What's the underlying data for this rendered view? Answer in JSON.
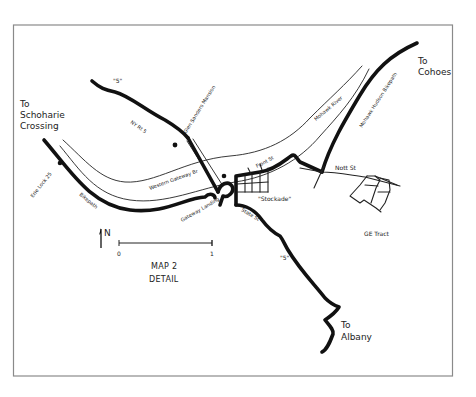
{
  "map": {
    "title_line1": "MAP 2",
    "title_line2": "DETAIL",
    "frame_color": "#8a8a8a",
    "ink_color": "#111111",
    "background": "#ffffff"
  },
  "destinations": {
    "schoharie_line1": "To",
    "schoharie_line2": "Schoharie",
    "schoharie_line3": "Crossing",
    "cohoes_line1": "To",
    "cohoes_line2": "Cohoes",
    "albany_line1": "To",
    "albany_line2": "Albany"
  },
  "route_labels": {
    "route5_north": "\"5\"",
    "route5_south": "\"5\"",
    "ny_rt5": "NY Rt 5"
  },
  "features": {
    "glen_sanders_mansion": "Glen Sanders Mansion",
    "western_gateway_br": "Western Gateway Br",
    "erie_lock_25": "Erie Lock 25",
    "bikepath": "Bikepath",
    "gateway_landing": "Gateway Landing",
    "mohawk_river": "Mohawk River",
    "mohawk_hudson_bikepath": "Mohawk Hudson Bikepath",
    "front_st": "Front St",
    "stockade": "\"Stockade\"",
    "state_st": "State St",
    "nott_st": "Nott St",
    "ge_tract": "GE Tract"
  },
  "legend": {
    "north_label": "N",
    "scale_start": "0",
    "scale_end": "1"
  }
}
